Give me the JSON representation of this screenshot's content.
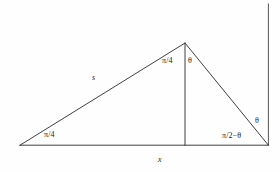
{
  "figure": {
    "name": "right-triangle-with-altitude",
    "background_color": "#fefefe",
    "stroke_color": "#2a2a2a",
    "text_color": "#1c1c1c"
  },
  "labels": {
    "angle_bottom_left": "π/4",
    "side_s": "s",
    "angle_apex_left": "π/4",
    "angle_apex_right": "θ",
    "angle_bottom_right": "π/2−θ",
    "angle_outer_right": "θ",
    "base_x": "x"
  },
  "geometry": {
    "vertex_left": [
      20,
      145
    ],
    "vertex_apex": [
      185,
      43
    ],
    "vertex_right": [
      268,
      145
    ],
    "altitude_foot": [
      185,
      145
    ],
    "baseline": [
      [
        20,
        145
      ],
      [
        268,
        145
      ]
    ],
    "left_side": [
      [
        20,
        145
      ],
      [
        185,
        43
      ]
    ],
    "right_side": [
      [
        185,
        43
      ],
      [
        268,
        145
      ]
    ],
    "altitude": [
      [
        185,
        43
      ],
      [
        185,
        145
      ]
    ],
    "page_border_line": [
      [
        268,
        4
      ],
      [
        268,
        145
      ]
    ]
  }
}
